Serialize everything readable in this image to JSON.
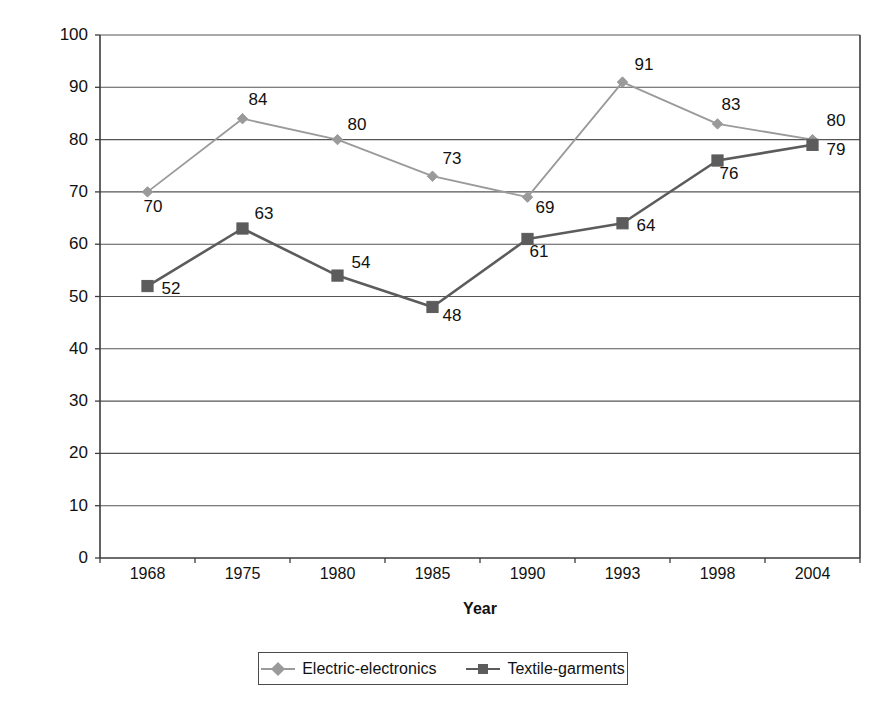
{
  "chart_data": {
    "type": "line",
    "title": "",
    "xlabel": "Year",
    "ylabel": "Percent (%)",
    "categories": [
      "1968",
      "1975",
      "1980",
      "1985",
      "1990",
      "1993",
      "1998",
      "2004"
    ],
    "ylim": [
      0,
      100
    ],
    "ytick_step": 10,
    "yticks": [
      "100",
      "90",
      "80",
      "70",
      "60",
      "50",
      "40",
      "30",
      "20",
      "10",
      "0"
    ],
    "grid": true,
    "legend_position": "bottom",
    "series": [
      {
        "name": "Electric-electronics",
        "marker": "diamond",
        "color": "#9a9a9a",
        "values": [
          70,
          84,
          80,
          73,
          69,
          91,
          83,
          80
        ],
        "labels": [
          "70",
          "84",
          "80",
          "73",
          "69",
          "91",
          "83",
          "80"
        ]
      },
      {
        "name": "Textile-garments",
        "marker": "square",
        "color": "#5c5c5c",
        "values": [
          52,
          63,
          54,
          48,
          61,
          64,
          76,
          79
        ],
        "labels": [
          "52",
          "63",
          "54",
          "48",
          "61",
          "64",
          "76",
          "79"
        ]
      }
    ]
  },
  "legend": {
    "entries": [
      {
        "label": "Electric-electronics"
      },
      {
        "label": "Textile-garments"
      }
    ]
  },
  "axes": {
    "y_title": "Percent (%)",
    "x_title": "Year"
  },
  "colors": {
    "series_1": "#9a9a9a",
    "series_2": "#5c5c5c",
    "axis": "#3c3c3c",
    "grid": "#555555",
    "text": "#111111",
    "background": "#ffffff"
  }
}
